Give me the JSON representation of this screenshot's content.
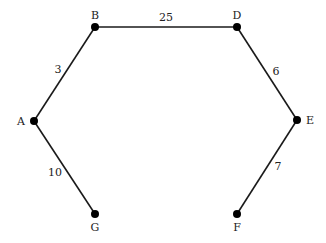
{
  "diagram": {
    "type": "weighted-graph",
    "nodes": [
      {
        "id": "A",
        "label": "A",
        "x": 34,
        "y": 121,
        "lx": 21,
        "ly": 125
      },
      {
        "id": "B",
        "label": "B",
        "x": 95,
        "y": 27,
        "lx": 95,
        "ly": 19
      },
      {
        "id": "D",
        "label": "D",
        "x": 237,
        "y": 27,
        "lx": 237,
        "ly": 19
      },
      {
        "id": "E",
        "label": "E",
        "x": 297,
        "y": 120,
        "lx": 310,
        "ly": 124
      },
      {
        "id": "F",
        "label": "F",
        "x": 237,
        "y": 214,
        "lx": 237,
        "ly": 231
      },
      {
        "id": "G",
        "label": "G",
        "x": 95,
        "y": 214,
        "lx": 95,
        "ly": 231
      }
    ],
    "edges": [
      {
        "from": "A",
        "to": "B",
        "weight": "3",
        "lx": 58,
        "ly": 73
      },
      {
        "from": "B",
        "to": "D",
        "weight": "25",
        "lx": 166,
        "ly": 21
      },
      {
        "from": "D",
        "to": "E",
        "weight": "6",
        "lx": 276,
        "ly": 75
      },
      {
        "from": "E",
        "to": "F",
        "weight": "7",
        "lx": 278,
        "ly": 170
      },
      {
        "from": "A",
        "to": "G",
        "weight": "10",
        "lx": 55,
        "ly": 176
      }
    ]
  }
}
